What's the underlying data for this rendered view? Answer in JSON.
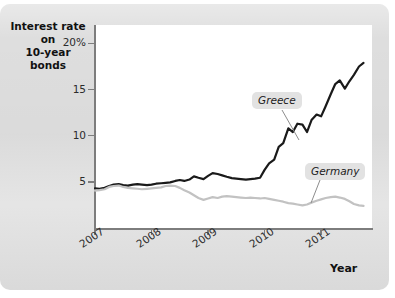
{
  "figure": {
    "title": "Interest rate on 10-year bonds",
    "title_line1": "Interest rate on",
    "title_line2": "10-year bonds",
    "x_axis_label": "Year",
    "panel_color": "#dedede",
    "plot_background": "#ffffff",
    "axis_color": "#7d7d7d"
  },
  "chart_data": {
    "type": "line",
    "title": "Interest rate on 10-year bonds",
    "xlabel": "Year",
    "ylabel": "Interest rate on 10-year bonds",
    "xlim": [
      2007.0,
      2011.9
    ],
    "ylim": [
      0,
      22
    ],
    "grid": false,
    "legend_position": "inline-annotations",
    "y_ticks": [
      5,
      10,
      15,
      20
    ],
    "y_tick_labels": [
      "5",
      "10",
      "15",
      "20%"
    ],
    "x_ticks": [
      2007,
      2008,
      2009,
      2010,
      2011
    ],
    "x_tick_labels": [
      "2007",
      "2008",
      "2009",
      "2010",
      "2011"
    ],
    "series": [
      {
        "name": "Greece",
        "color": "#1a1a1a",
        "label_text": "Greece",
        "x": [
          2007.0,
          2007.08,
          2007.17,
          2007.25,
          2007.33,
          2007.42,
          2007.5,
          2007.58,
          2007.67,
          2007.75,
          2007.83,
          2007.92,
          2008.0,
          2008.08,
          2008.17,
          2008.25,
          2008.33,
          2008.42,
          2008.5,
          2008.58,
          2008.67,
          2008.75,
          2008.83,
          2008.92,
          2009.0,
          2009.08,
          2009.17,
          2009.25,
          2009.33,
          2009.42,
          2009.5,
          2009.58,
          2009.67,
          2009.75,
          2009.83,
          2009.92,
          2010.0,
          2010.08,
          2010.17,
          2010.25,
          2010.33,
          2010.42,
          2010.5,
          2010.58,
          2010.67,
          2010.75,
          2010.83,
          2010.92,
          2011.0,
          2011.08,
          2011.17,
          2011.25,
          2011.33,
          2011.42,
          2011.5,
          2011.58,
          2011.67,
          2011.75
        ],
        "y": [
          4.3,
          4.25,
          4.35,
          4.55,
          4.7,
          4.75,
          4.65,
          4.6,
          4.7,
          4.75,
          4.7,
          4.65,
          4.7,
          4.8,
          4.85,
          4.9,
          4.95,
          5.1,
          5.2,
          5.1,
          5.25,
          5.6,
          5.45,
          5.3,
          5.65,
          5.95,
          5.85,
          5.7,
          5.55,
          5.4,
          5.35,
          5.3,
          5.25,
          5.3,
          5.35,
          5.45,
          6.3,
          7.0,
          7.4,
          8.8,
          9.2,
          10.8,
          10.4,
          11.3,
          11.2,
          10.4,
          11.7,
          12.3,
          12.1,
          13.2,
          14.5,
          15.6,
          16.0,
          15.1,
          15.9,
          16.6,
          17.5,
          17.9
        ]
      },
      {
        "name": "Germany",
        "color": "#c2c2c2",
        "label_text": "Germany",
        "x": [
          2007.0,
          2007.08,
          2007.17,
          2007.25,
          2007.33,
          2007.42,
          2007.5,
          2007.58,
          2007.67,
          2007.75,
          2007.83,
          2007.92,
          2008.0,
          2008.08,
          2008.17,
          2008.25,
          2008.33,
          2008.42,
          2008.5,
          2008.58,
          2008.67,
          2008.75,
          2008.83,
          2008.92,
          2009.0,
          2009.08,
          2009.17,
          2009.25,
          2009.33,
          2009.42,
          2009.5,
          2009.58,
          2009.67,
          2009.75,
          2009.83,
          2009.92,
          2010.0,
          2010.08,
          2010.17,
          2010.25,
          2010.33,
          2010.42,
          2010.5,
          2010.58,
          2010.67,
          2010.75,
          2010.83,
          2010.92,
          2011.0,
          2011.08,
          2011.17,
          2011.25,
          2011.33,
          2011.42,
          2011.5,
          2011.58,
          2011.67,
          2011.75
        ],
        "y": [
          4.05,
          4.1,
          4.2,
          4.45,
          4.55,
          4.6,
          4.45,
          4.35,
          4.3,
          4.25,
          4.2,
          4.25,
          4.3,
          4.35,
          4.4,
          4.55,
          4.6,
          4.55,
          4.35,
          4.1,
          3.85,
          3.55,
          3.25,
          3.05,
          3.2,
          3.35,
          3.25,
          3.4,
          3.45,
          3.4,
          3.35,
          3.3,
          3.25,
          3.3,
          3.25,
          3.2,
          3.25,
          3.15,
          3.05,
          2.95,
          2.85,
          2.7,
          2.65,
          2.55,
          2.45,
          2.55,
          2.75,
          2.95,
          3.1,
          3.25,
          3.35,
          3.4,
          3.3,
          3.15,
          2.9,
          2.6,
          2.45,
          2.4
        ]
      }
    ]
  }
}
